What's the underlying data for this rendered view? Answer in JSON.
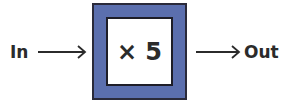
{
  "diagram": {
    "input_label": "In",
    "output_label": "Out",
    "operation": "× 5",
    "colors": {
      "box_fill": "#5b6fae",
      "box_border": "#2a2a3a",
      "inner_fill": "#ffffff",
      "text": "#2b2b2b"
    }
  }
}
